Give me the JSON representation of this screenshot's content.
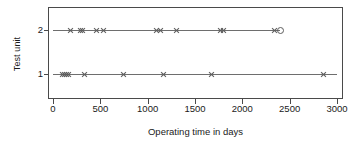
{
  "chart_data": {
    "type": "scatter",
    "title": "",
    "xlabel": "Operating time in days",
    "ylabel": "Test unit",
    "xlim": [
      0,
      3000
    ],
    "xticks": [
      0,
      500,
      1000,
      1500,
      2000,
      2500,
      3000
    ],
    "xtick_labels": [
      "0",
      "500",
      "1000",
      "1500",
      "2000",
      "2500",
      "3000"
    ],
    "yticks": [
      1,
      2
    ],
    "ytick_labels": [
      "1",
      "2"
    ],
    "grid": false,
    "legend": false,
    "marker_colors": {
      "failure": "#5c5c5c",
      "censored": "#5c5c5c",
      "line": "#6e6e6e",
      "frame": "#4a4a4a"
    },
    "series": [
      {
        "name": "Test unit 2",
        "y": 2,
        "line_end": 2400,
        "failures": [
          180,
          285,
          310,
          450,
          530,
          1090,
          1130,
          1300,
          1760,
          1800,
          2330
        ],
        "censored": [
          2400
        ]
      },
      {
        "name": "Test unit 1",
        "y": 1,
        "line_end": 3000,
        "failures": [
          95,
          120,
          140,
          160,
          330,
          740,
          1160,
          1670,
          2850
        ],
        "censored": []
      }
    ]
  }
}
